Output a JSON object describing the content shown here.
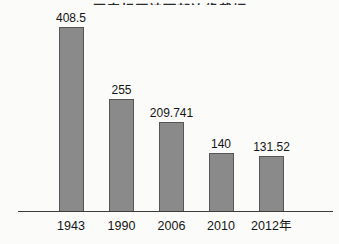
{
  "page": {
    "background_color": "#fbfbfa",
    "width_px": 339,
    "height_px": 244
  },
  "header": {
    "clipped_title_text": "图表标题被顶部边缘裁切",
    "clipped": true
  },
  "chart_data": {
    "type": "bar",
    "categories": [
      "1943",
      "1990",
      "2006",
      "2010",
      "2012年"
    ],
    "values": [
      408.5,
      255,
      209.741,
      140,
      131.52
    ],
    "value_labels": [
      "408.5",
      "255",
      "209.741",
      "140",
      "131.52"
    ],
    "title": "",
    "xlabel": "",
    "ylabel": "",
    "ylim": [
      0,
      450
    ],
    "grid": false,
    "legend": false,
    "bar_color": "#8a8a8a",
    "bar_border_color": "#565656",
    "axis_color": "#3c3c3c",
    "label_color": "#141414",
    "layout": {
      "baseline_y": 211,
      "bar_width": 25,
      "bar_centers_x": [
        71,
        121.5,
        171.5,
        221,
        271.5
      ],
      "bar_heights_px": [
        184,
        112,
        89,
        58,
        55
      ],
      "axis_left": 18,
      "axis_right": 333,
      "year_label_top": 219
    }
  }
}
